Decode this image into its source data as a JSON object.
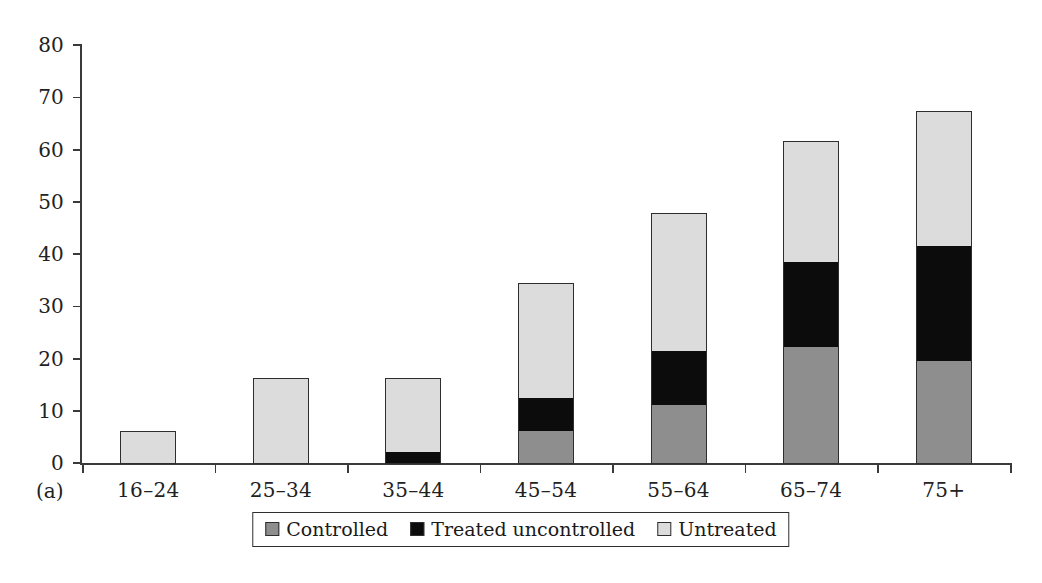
{
  "panel": {
    "label": "(a)"
  },
  "legend": {
    "items": [
      {
        "label": "Controlled",
        "swatch": "controlled",
        "color": "#8e8e8e"
      },
      {
        "label": "Treated uncontrolled",
        "swatch": "treated",
        "color": "#0c0c0c"
      },
      {
        "label": "Untreated",
        "swatch": "untreated",
        "color": "#dcdcdc"
      }
    ]
  },
  "chart_data": {
    "type": "bar",
    "title": "",
    "subtitle": "",
    "xlabel": "",
    "ylabel": "",
    "stacked": true,
    "grid": false,
    "legend_position": "bottom",
    "ylim": [
      0,
      80
    ],
    "yticks": [
      0,
      10,
      20,
      30,
      40,
      50,
      60,
      70,
      80
    ],
    "ytick_labels": [
      "0",
      "10",
      "20",
      "30",
      "40",
      "50",
      "60",
      "70",
      "80"
    ],
    "categories": [
      "16–24",
      "25–34",
      "35–44",
      "45–54",
      "55–64",
      "65–74",
      "75+"
    ],
    "series": [
      {
        "name": "Controlled",
        "color": "#8e8e8e",
        "values": [
          0,
          0,
          0,
          6.2,
          11.1,
          22.2,
          19.5
        ]
      },
      {
        "name": "Treated uncontrolled",
        "color": "#0c0c0c",
        "values": [
          0,
          0,
          2.1,
          6.2,
          10.3,
          16.3,
          22.0
        ]
      },
      {
        "name": "Untreated",
        "color": "#dcdcdc",
        "values": [
          6.0,
          16.1,
          14.0,
          21.9,
          26.3,
          22.9,
          25.7
        ]
      }
    ],
    "totals": [
      6.0,
      16.1,
      16.1,
      34.3,
      47.7,
      61.4,
      67.2
    ]
  }
}
